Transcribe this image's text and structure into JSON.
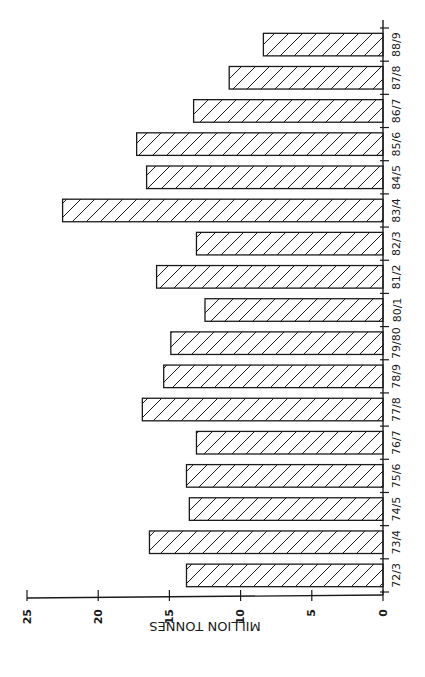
{
  "chart_data": {
    "type": "bar",
    "orientation": "horizontal-rotated",
    "title": "",
    "xlabel": "",
    "ylabel": "MILLION TONNES",
    "categories": [
      "72/3",
      "73/4",
      "74/5",
      "75/6",
      "76/7",
      "77/8",
      "78/9",
      "79/80",
      "80/1",
      "81/2",
      "82/3",
      "83/4",
      "84/5",
      "85/6",
      "86/7",
      "87/8",
      "88/9"
    ],
    "values": [
      13.8,
      16.4,
      13.6,
      13.8,
      13.1,
      16.9,
      15.4,
      14.9,
      12.5,
      15.9,
      13.1,
      22.5,
      16.6,
      17.3,
      13.3,
      10.8,
      8.4
    ],
    "ylim": [
      0,
      25
    ],
    "yticks": [
      0,
      5,
      10,
      15,
      20,
      25
    ],
    "grid": false,
    "legend": null,
    "bar_fill": "diagonal-hatch",
    "colors": {
      "ink": "#1a1a1a",
      "background": "#ffffff"
    }
  }
}
